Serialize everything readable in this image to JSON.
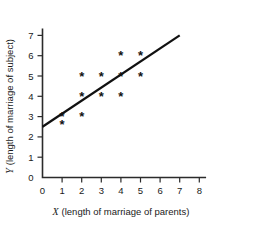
{
  "chart_data": {
    "type": "scatter",
    "title": "",
    "xlabel": "X (length of marriage of parents)",
    "ylabel": "Y (length of marriage of subject)",
    "xlabel_var": "X",
    "xlabel_rest": "(length of marriage of parents)",
    "ylabel_var": "Y",
    "ylabel_rest": "(length of marriage of subject)",
    "xlim": [
      0,
      8
    ],
    "ylim": [
      0,
      7
    ],
    "xticks": [
      0,
      1,
      2,
      3,
      4,
      5,
      6,
      7,
      8
    ],
    "yticks": [
      0,
      1,
      2,
      3,
      4,
      5,
      6,
      7
    ],
    "xticklabels": [
      "0",
      "1",
      "2",
      "3",
      "4",
      "5",
      "6",
      "7",
      "8"
    ],
    "yticklabels": [
      "0",
      "1",
      "2",
      "3",
      "4",
      "5",
      "6",
      "7"
    ],
    "grid": false,
    "legend": false,
    "marker_glyph": "*",
    "points": [
      {
        "x": 1,
        "y": 3.0
      },
      {
        "x": 1,
        "y": 2.6
      },
      {
        "x": 2,
        "y": 5.0
      },
      {
        "x": 2,
        "y": 4.0
      },
      {
        "x": 2,
        "y": 3.0
      },
      {
        "x": 3,
        "y": 5.0
      },
      {
        "x": 3,
        "y": 4.0
      },
      {
        "x": 4,
        "y": 6.0
      },
      {
        "x": 4,
        "y": 5.0
      },
      {
        "x": 4,
        "y": 4.0
      },
      {
        "x": 5,
        "y": 6.0
      },
      {
        "x": 5,
        "y": 5.0
      }
    ],
    "fit_line": {
      "x0": 0,
      "y0": 2.5,
      "x1": 7,
      "y1": 7.0,
      "slope": 0.643,
      "intercept": 2.5
    },
    "colors": {
      "axis": "#2b2b2b",
      "marker": "#111111",
      "line": "#111111",
      "background": "#ffffff"
    }
  }
}
